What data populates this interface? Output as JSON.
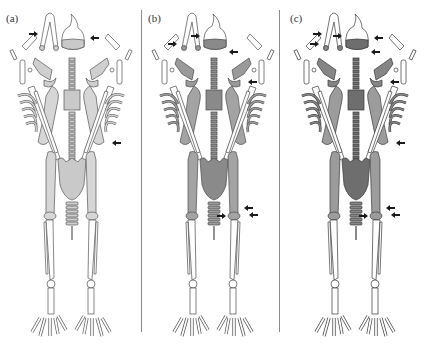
{
  "figure": {
    "panels": [
      {
        "label": "(a)",
        "scheme": "light",
        "colors": {
          "axial": "#c9c9c9",
          "limb": "#d6d6d6",
          "girdle": "#cfcfcf",
          "distal": "#ffffff",
          "outline": "#555555"
        },
        "arrows": [
          "skull-right",
          "clavicle-left",
          "radius-right-distal"
        ]
      },
      {
        "label": "(b)",
        "scheme": "medium",
        "colors": {
          "axial": "#8a8a8a",
          "limb": "#a3a3a3",
          "girdle": "#9a9a9a",
          "distal": "#ffffff",
          "outline": "#4a4a4a"
        },
        "arrows": [
          "mandible-left",
          "skull-left",
          "skull-bottom",
          "humerus-right",
          "tibia-right-a",
          "tibia-right-b",
          "fibula-right"
        ]
      },
      {
        "label": "(c)",
        "scheme": "dark",
        "colors": {
          "axial": "#6e6e6e",
          "limb": "#9c9c9c",
          "girdle": "#858585",
          "distal": "#ffffff",
          "outline": "#3a3a3a"
        },
        "arrows": [
          "clavicle-left",
          "mandible-left",
          "skull-left",
          "skull-right",
          "skull-bottom",
          "humerus-right",
          "radius-right-distal",
          "tibia-right-a",
          "tibia-right-b",
          "fibula-right"
        ]
      }
    ],
    "arrow_color": "#1a1a1a",
    "divider_color": "#8a8a8a"
  }
}
